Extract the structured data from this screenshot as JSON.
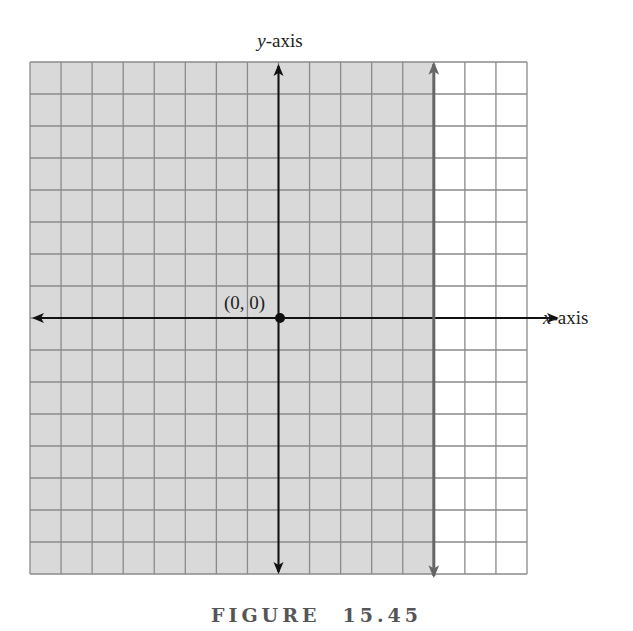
{
  "figure": {
    "caption_word": "FIGURE",
    "caption_number": "15.45",
    "y_axis_label_var": "y",
    "y_axis_label_rest": "-axis",
    "x_axis_label_var": "x",
    "x_axis_label_rest": "-axis",
    "origin_label": "(0, 0)"
  },
  "grid": {
    "columns": 16,
    "rows": 16,
    "left_px": 30,
    "top_px": 62,
    "right_px": 527,
    "bottom_px": 574,
    "y_axis_column": 8,
    "x_axis_row": 8,
    "shaded_columns_from_left": 13,
    "boundary_line": "vertical line at x = 5 (dashed/gray, with arrows), region to the left shaded"
  },
  "colors": {
    "shade": "#d9d9d9",
    "grid_line": "#8a8a8a",
    "axis": "#111111",
    "boundary": "#666666",
    "caption": "#555555"
  }
}
